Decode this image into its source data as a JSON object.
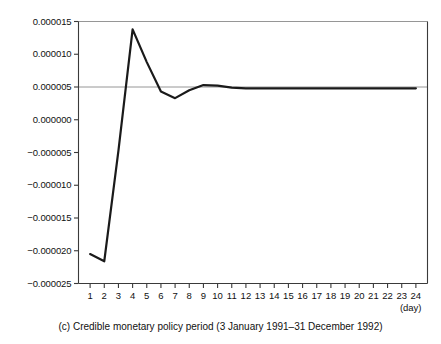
{
  "chart_data": {
    "type": "line",
    "title": "",
    "caption": "(c) Credible monetary policy period (3 January 1991–31 December 1992)",
    "panel_label": "(c)",
    "xlabel": "(day)",
    "ylabel": "",
    "grid": true,
    "legend": "none",
    "xlim": [
      0.18,
      24.82
    ],
    "ylim": [
      -2.5e-05,
      1.5e-05
    ],
    "x": [
      1,
      2,
      3,
      4,
      5,
      6,
      7,
      8,
      9,
      10,
      11,
      12,
      13,
      14,
      15,
      16,
      17,
      18,
      19,
      20,
      21,
      22,
      23,
      24
    ],
    "xticklabels": [
      "1",
      "2",
      "3",
      "4",
      "5",
      "6",
      "7",
      "8",
      "9",
      "10",
      "11",
      "12",
      "13",
      "14",
      "15",
      "16",
      "17",
      "18",
      "19",
      "20",
      "21",
      "22",
      "23",
      "24"
    ],
    "yticks": [
      1.5e-05,
      1e-05,
      5e-06,
      0.0,
      -5e-06,
      -1e-05,
      -1.5e-05,
      -2e-05,
      -2.5e-05
    ],
    "yticklabels": [
      "0.000015",
      "0.000010",
      "0.000005",
      "0.000000",
      "−0.000005",
      "−0.000010",
      "−0.000015",
      "−0.000020",
      "−0.000025"
    ],
    "gridlines_y": [
      1.5e-05,
      5e-06
    ],
    "series": [
      {
        "name": "impulse response",
        "color": "#1a1a1a",
        "linewidth": 2.2,
        "values": [
          -2.05e-05,
          -2.16e-05,
          -4.7e-06,
          1.38e-05,
          8.8e-06,
          4.3e-06,
          3.3e-06,
          4.5e-06,
          5.3e-06,
          5.2e-06,
          4.9e-06,
          4.8e-06,
          4.8e-06,
          4.8e-06,
          4.8e-06,
          4.8e-06,
          4.8e-06,
          4.8e-06,
          4.8e-06,
          4.8e-06,
          4.8e-06,
          4.8e-06,
          4.8e-06,
          4.8e-06
        ]
      }
    ]
  },
  "colors": {
    "line": "#1a1a1a",
    "axis": "#3a3a3a",
    "grid": "#8a8a8a",
    "background": "#ffffff",
    "text": "#111111"
  }
}
